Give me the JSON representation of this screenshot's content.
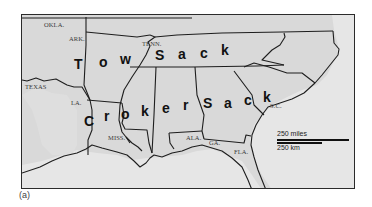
{
  "figure": {
    "caption": "(a)",
    "background_color": "#d9d9d9",
    "border_color": "#2b2b2b"
  },
  "state_labels": {
    "okla": "OKLA.",
    "ark": "ARK.",
    "tenn": "TENN.",
    "texas": "TEXAS",
    "la": "LA.",
    "miss": "MISS.",
    "ala": "ALA.",
    "ga": "GA.",
    "fla": "FLA.",
    "sc": "S.C."
  },
  "overlay_words": {
    "tow_sack": {
      "word1": [
        "T",
        "o",
        "w"
      ],
      "word2": [
        "S",
        "a",
        "c",
        "k"
      ]
    },
    "croker_sack": {
      "word1": [
        "C",
        "r",
        "o",
        "k",
        "e",
        "r"
      ],
      "word2": [
        "S",
        "a",
        "c",
        "k"
      ]
    }
  },
  "scale": {
    "miles_label": "250 miles",
    "km_label": "250 km"
  }
}
